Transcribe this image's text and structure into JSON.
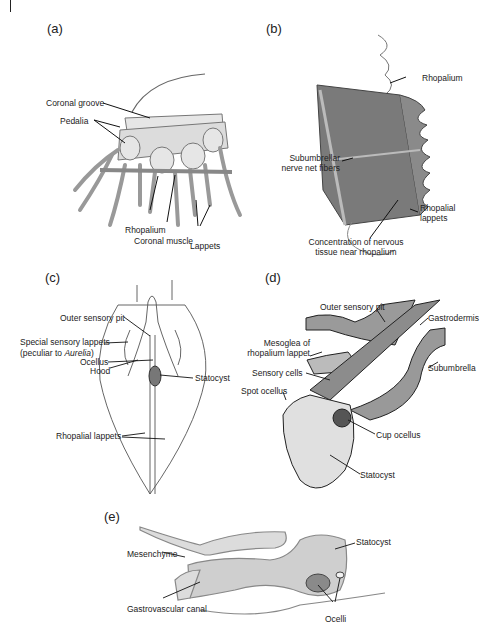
{
  "figure": {
    "panels": [
      {
        "id": "a",
        "letter": "(a)",
        "labels": {
          "coronal_groove": "Coronal groove",
          "pedalia": "Pedalia",
          "rhopalium": "Rhopalium",
          "coronal_muscle": "Coronal muscle",
          "lappets": "Lappets"
        }
      },
      {
        "id": "b",
        "letter": "(b)",
        "labels": {
          "rhopalium": "Rhopalium",
          "subumbrellar_1": "Subumbrellar",
          "subumbrellar_2": "nerve net fibers",
          "rhopalial_lappets_1": "Rhopalial",
          "rhopalial_lappets_2": "lappets",
          "concentration_1": "Concentration of nervous",
          "concentration_2": "tissue near rhopalium"
        }
      },
      {
        "id": "c",
        "letter": "(c)",
        "labels": {
          "outer_sensory_pit": "Outer sensory pit",
          "special_sensory_lappets": "Special sensory lappets",
          "peculiar_prefix": "(peculiar to ",
          "peculiar_genus": "Aurelia",
          "peculiar_suffix": ")",
          "ocellus": "Ocellus",
          "hood": "Hood",
          "statocyst": "Statocyst",
          "rhopalial_lappets": "Rhopalial lappets"
        }
      },
      {
        "id": "d",
        "letter": "(d)",
        "labels": {
          "outer_sensory_pit": "Outer sensory pit",
          "gastrodermis": "Gastrodermis",
          "mesoglea_1": "Mesoglea of",
          "mesoglea_2": "rhopalium lappet",
          "subumbrella": "Subumbrella",
          "sensory_cells": "Sensory cells",
          "spot_ocellus": "Spot ocellus",
          "cup_ocellus": "Cup ocellus",
          "statocyst": "Statocyst"
        }
      },
      {
        "id": "e",
        "letter": "(e)",
        "labels": {
          "statocyst": "Statocyst",
          "mesenchyme": "Mesenchyme",
          "gastrovascular_canal": "Gastrovascular canal",
          "ocelli": "Ocelli"
        }
      }
    ]
  }
}
